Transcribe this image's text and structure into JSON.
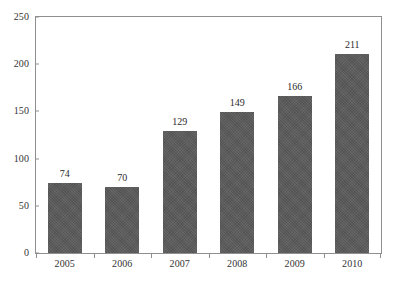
{
  "chart_data": {
    "type": "bar",
    "title": "",
    "subtitle": "",
    "xlabel": "",
    "ylabel": "",
    "categories": [
      "2005",
      "2006",
      "2007",
      "2008",
      "2009",
      "2010"
    ],
    "values": [
      74,
      70,
      129,
      149,
      166,
      211
    ],
    "data_labels": [
      "74",
      "70",
      "129",
      "149",
      "166",
      "211"
    ],
    "ylim": [
      0,
      250
    ],
    "ytick_values": [
      0,
      50,
      100,
      150,
      200,
      250
    ],
    "ytick_labels": [
      "0",
      "50",
      "100",
      "150",
      "200",
      "250"
    ],
    "grid": false,
    "legend": null,
    "legend_position": "none",
    "series": [
      {
        "name": "",
        "values": [
          74,
          70,
          129,
          149,
          166,
          211
        ],
        "color": "#5a5a5a"
      }
    ],
    "colors": {
      "bar_fill": "#5a5a5a",
      "axis_line": "#8f8f8f",
      "text": "#2a2a2a",
      "background": "#ffffff"
    }
  },
  "footer": {
    "caption_fragment": ""
  }
}
